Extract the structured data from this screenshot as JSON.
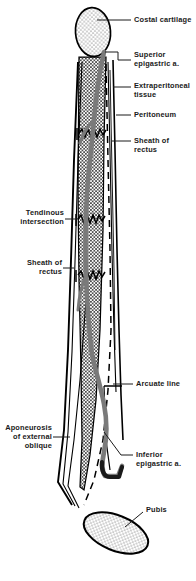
{
  "figure": {
    "colors": {
      "outline": "#000000",
      "artery": "#7a7a7a",
      "stipple_fill": "#f2f2f2",
      "muscle_fill": "#ffffff",
      "background": "#ffffff"
    }
  },
  "labels": {
    "costal_cartilage": "Costal cartilage",
    "superior_epigastric": "Superior\nepigastric a.",
    "extraperitoneal_tissue": "Extraperitoneal\ntissue",
    "peritoneum": "Peritoneum",
    "sheath_of_rectus_upper": "Sheath of\nrectus",
    "tendinous_intersection": "Tendinous\nintersection",
    "sheath_of_rectus_lower": "Sheath of\nrectus",
    "arcuate_line": "Arcuate line",
    "aponeurosis_external_oblique": "Aponeurosis\nof external\noblique",
    "inferior_epigastric": "Inferior\nepigastric a.",
    "pubis": "Pubis"
  }
}
